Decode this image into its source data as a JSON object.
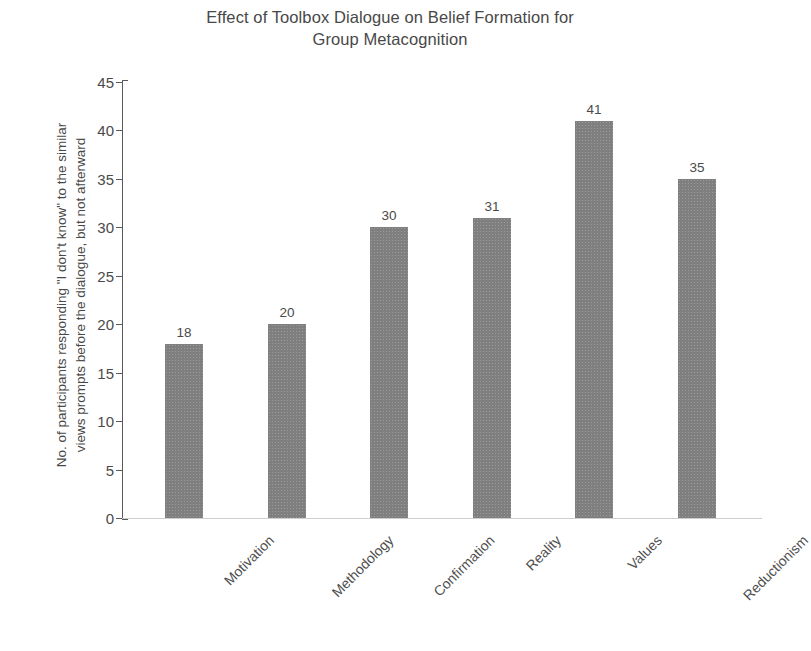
{
  "chart_data": {
    "type": "bar",
    "title": "Effect of Toolbox Dialogue on Belief Formation for\nGroup Metacognition",
    "xlabel": "",
    "ylabel": "No. of participants responding \"I don't know\" to the similar\nviews prompts before the dialogue, but not afterward",
    "categories": [
      "Motivation",
      "Methodology",
      "Confirmation",
      "Reality",
      "Values",
      "Reductionism"
    ],
    "values": [
      18,
      20,
      30,
      31,
      41,
      35
    ],
    "value_labels": [
      "18",
      "20",
      "30",
      "31",
      "41",
      "35"
    ],
    "ylim": [
      0,
      45
    ],
    "ytick_labels": [
      "45",
      "40",
      "35",
      "30",
      "25",
      "20",
      "15",
      "10",
      "5",
      "0"
    ],
    "ytick_values": [
      45,
      40,
      35,
      30,
      25,
      20,
      15,
      10,
      5,
      0
    ],
    "grid": false,
    "legend": false,
    "bar_color": "#7f7f7f",
    "axis_color": "#5a5a5a",
    "text_color": "#484848"
  }
}
